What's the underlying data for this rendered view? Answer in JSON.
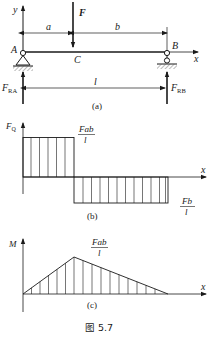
{
  "figure": {
    "caption": "图 5.7",
    "beam_diagram": {
      "label": "(a)",
      "axis_y": "y",
      "axis_x": "x",
      "point_a": "A",
      "point_b": "B",
      "point_c": "C",
      "force": "F",
      "dim_a": "a",
      "dim_b": "b",
      "dim_l": "l",
      "reaction_a": {
        "main": "F",
        "sub": "RA"
      },
      "reaction_b": {
        "main": "F",
        "sub": "RB"
      }
    },
    "shear_diagram": {
      "label": "(b)",
      "axis_y": {
        "main": "F",
        "sub": "Q"
      },
      "axis_x": "x",
      "top_value": {
        "num": "Fab",
        "den": "l"
      },
      "bottom_value": {
        "num": "Fb",
        "den": "l"
      }
    },
    "moment_diagram": {
      "label": "(c)",
      "axis_y": "M",
      "axis_x": "x",
      "peak_value": {
        "num": "Fab",
        "den": "l"
      }
    }
  }
}
